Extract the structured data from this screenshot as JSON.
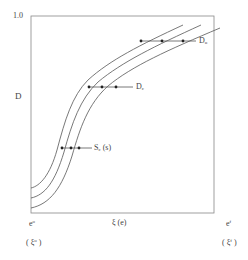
{
  "diagram": {
    "y_axis": {
      "top_label": "1.0",
      "label": "D"
    },
    "x_axis": {
      "label": "ξ (e)",
      "left_label": {
        "base": "e",
        "sup": "o"
      },
      "left_sublabel": {
        "base": "( ξ",
        "sup": "o",
        "tail": " )"
      },
      "right_label": {
        "base": "e",
        "sup": "f"
      },
      "right_sublabel": {
        "base": "( ξ",
        "sup": "f",
        "tail": " )"
      }
    },
    "curves_count": 3,
    "annotations": [
      {
        "id": "du",
        "text": "D",
        "sub": "u",
        "level_fraction": 0.88
      },
      {
        "id": "dc",
        "text": "D",
        "sub": "c",
        "level_fraction": 0.64
      },
      {
        "id": "sc",
        "text": "S",
        "sub": "c",
        "tail": " (s)",
        "level_fraction": 0.33
      }
    ]
  }
}
